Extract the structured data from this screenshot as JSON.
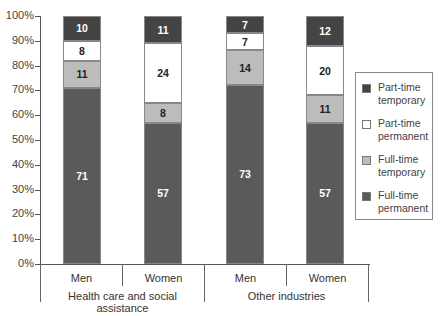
{
  "chart_data": {
    "type": "bar",
    "stacked": true,
    "percent": true,
    "title": "",
    "xlabel": "",
    "ylabel": "",
    "ylim": [
      0,
      100
    ],
    "y_ticks": [
      "0%",
      "10%",
      "20%",
      "30%",
      "40%",
      "50%",
      "60%",
      "70%",
      "80%",
      "90%",
      "100%"
    ],
    "groups": [
      "Health care and social assistance",
      "Other industries"
    ],
    "categories": [
      "Men",
      "Women",
      "Men",
      "Women"
    ],
    "series": [
      {
        "name": "Full-time permanent",
        "color": "#5a5a5a",
        "label_color": "#ffffff",
        "values": [
          71,
          57,
          73,
          57
        ]
      },
      {
        "name": "Full-time temporary",
        "color": "#bcbcbc",
        "label_color": "#222222",
        "values": [
          11,
          8,
          14,
          11
        ]
      },
      {
        "name": "Part-time permanent",
        "color": "#ffffff",
        "label_color": "#222222",
        "values": [
          8,
          24,
          7,
          20
        ]
      },
      {
        "name": "Part-time temporary",
        "color": "#444444",
        "label_color": "#ffffff",
        "values": [
          10,
          11,
          7,
          12
        ]
      }
    ],
    "legend": {
      "position": "right",
      "entries": [
        "Part-time temporary",
        "Part-time permanent",
        "Full-time temporary",
        "Full-time permanent"
      ]
    },
    "grid": false
  },
  "labels": {
    "y_ticks": [
      "0%",
      "10%",
      "20%",
      "30%",
      "40%",
      "50%",
      "60%",
      "70%",
      "80%",
      "90%",
      "100%"
    ],
    "categories": [
      "Men",
      "Women",
      "Men",
      "Women"
    ],
    "groups": [
      "Health care and social assistance",
      "Other industries"
    ],
    "legend": [
      {
        "line1": "Part-time",
        "line2": "temporary",
        "color": "#444444"
      },
      {
        "line1": "Part-time",
        "line2": "permanent",
        "color": "#ffffff"
      },
      {
        "line1": "Full-time",
        "line2": "temporary",
        "color": "#bcbcbc"
      },
      {
        "line1": "Full-time",
        "line2": "permanent",
        "color": "#5a5a5a"
      }
    ]
  }
}
